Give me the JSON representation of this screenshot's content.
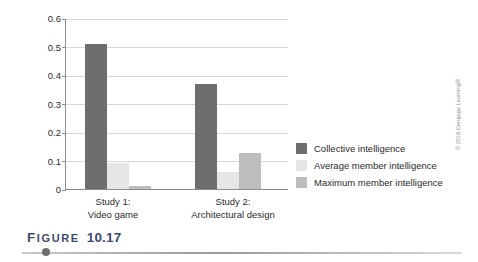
{
  "figure": {
    "caption_word_first": "F",
    "caption_word_rest": "IGURE",
    "caption_number": "10.17",
    "copyright": "© 2016 Cengage Learning®"
  },
  "chart_data": {
    "type": "bar",
    "title": "",
    "xlabel": "",
    "ylabel": "Ability to predict performance",
    "ylim": [
      0,
      0.6
    ],
    "yticks": [
      "0",
      "0.1",
      "0.2",
      "0.3",
      "0.4",
      "0.5",
      "0.6"
    ],
    "ytick_values": [
      0,
      0.1,
      0.2,
      0.3,
      0.4,
      0.5,
      0.6
    ],
    "grid": true,
    "legend_position": "right",
    "categories": [
      "Study 1: Video game",
      "Study 2: Architectural design"
    ],
    "category_lines": [
      [
        "Study 1:",
        "Video game"
      ],
      [
        "Study 2:",
        "Architectural design"
      ]
    ],
    "series": [
      {
        "name": "Collective intelligence",
        "color": "#6e6e6e",
        "values": [
          0.51,
          0.37
        ]
      },
      {
        "name": "Average member intelligence",
        "color": "#e6e6e6",
        "values": [
          0.09,
          0.06
        ]
      },
      {
        "name": "Maximum member intelligence",
        "color": "#bdbdbd",
        "values": [
          0.01,
          0.125
        ]
      }
    ]
  }
}
